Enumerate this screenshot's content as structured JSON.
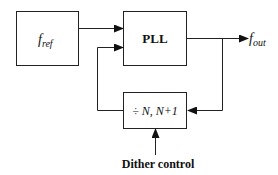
{
  "diagram": {
    "type": "block-diagram",
    "blocks": {
      "reference": {
        "label_main": "f",
        "label_sub": "ref"
      },
      "pll": {
        "label": "PLL"
      },
      "divider": {
        "label": "÷ N, N+1"
      }
    },
    "output": {
      "label_main": "f",
      "label_sub": "out"
    },
    "control": {
      "label": "Dither control"
    },
    "connections": [
      {
        "from": "reference",
        "to": "pll"
      },
      {
        "from": "pll",
        "to": "output"
      },
      {
        "from": "pll",
        "to": "divider",
        "via": "feedback-branch"
      },
      {
        "from": "divider",
        "to": "pll"
      },
      {
        "from": "control",
        "to": "divider"
      }
    ],
    "colors": {
      "stroke": "#222222",
      "background": "#ffffff"
    }
  }
}
